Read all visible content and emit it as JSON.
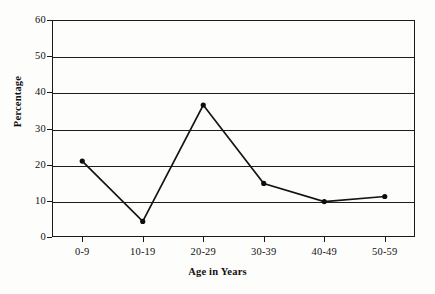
{
  "chart_data": {
    "type": "line",
    "title": "",
    "xlabel": "Age in Years",
    "ylabel": "Percentage",
    "categories": [
      "0-9",
      "10-19",
      "20-29",
      "30-39",
      "40-49",
      "50-59"
    ],
    "values": [
      21,
      4.3,
      36.5,
      14.8,
      9.8,
      11.2
    ],
    "series": [
      {
        "name": "Percentage",
        "values": [
          21,
          4.3,
          36.5,
          14.8,
          9.8,
          11.2
        ]
      }
    ],
    "ylim": [
      0,
      60
    ],
    "ytick_labels": [
      "0",
      "10",
      "20",
      "30",
      "40",
      "50",
      "60"
    ],
    "ytick_values": [
      0,
      10,
      20,
      30,
      40,
      50,
      60
    ],
    "grid": true,
    "legend": "none",
    "line_color": "#141414",
    "marker_color": "#0d0d0d",
    "axis_color": "#1a1a1a",
    "background_color": "#fdfdfb"
  }
}
